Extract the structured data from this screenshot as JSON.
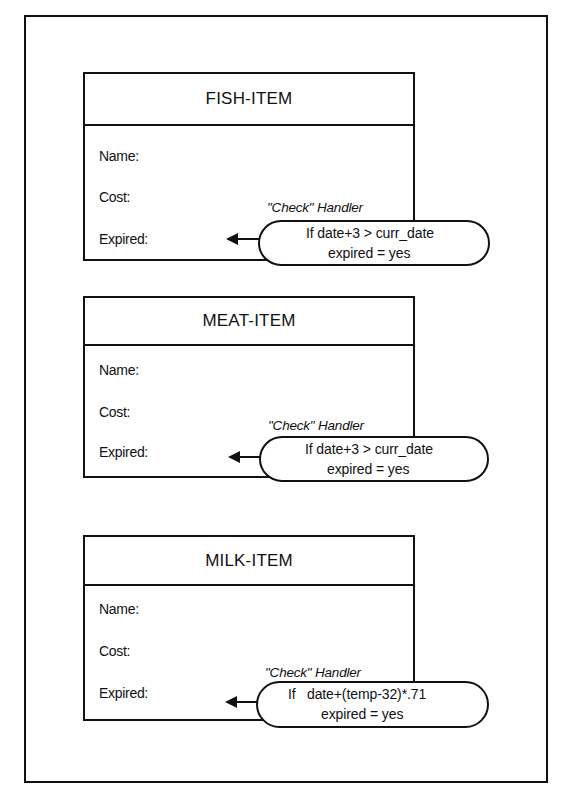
{
  "diagram": {
    "type": "object-event-handlers",
    "objects": [
      {
        "title": "FISH-ITEM",
        "fields": [
          "Name:",
          "Cost:",
          "Expired:"
        ],
        "handler": {
          "label": "\"Check\" Handler",
          "line1": "If date+3 > curr_date",
          "line2": "expired = yes",
          "points_to": "Expired:"
        }
      },
      {
        "title": "MEAT-ITEM",
        "fields": [
          "Name:",
          "Cost:",
          "Expired:"
        ],
        "handler": {
          "label": "\"Check\" Handler",
          "line1": "If date+3 > curr_date",
          "line2": "expired = yes",
          "points_to": "Expired:"
        }
      },
      {
        "title": "MILK-ITEM",
        "fields": [
          "Name:",
          "Cost:",
          "Expired:"
        ],
        "handler": {
          "label": "\"Check\" Handler",
          "line1": "If   date+(temp-32)*.71",
          "line2": "expired = yes",
          "points_to": "Expired:"
        }
      }
    ],
    "colors": {
      "stroke": "#111111",
      "background": "#ffffff"
    }
  }
}
